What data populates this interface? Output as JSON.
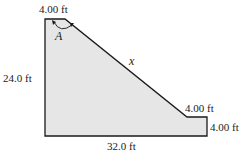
{
  "diagram": {
    "type": "cross-section",
    "fill_color": "#e6e6e6",
    "stroke_color": "#1a1a1a",
    "labels": {
      "top_width": "4.00 ft",
      "angle": "A",
      "slant": "x",
      "left_height": "24.0 ft",
      "step_width": "4.00 ft",
      "step_height": "4.00 ft",
      "bottom_width": "32.0 ft"
    }
  }
}
